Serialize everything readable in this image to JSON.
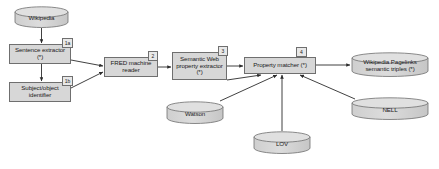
{
  "diagram": {
    "background": "#ffffff",
    "node_fill": "#d7d7d7",
    "node_stroke": "#6f6f6f",
    "badge_fill": "#e8e8e8",
    "nodes": [
      {
        "id": "wikipedia",
        "type": "cylinder",
        "label": "Wikipedia",
        "x": 14,
        "y": 6,
        "w": 55,
        "h": 22
      },
      {
        "id": "sentence",
        "type": "process",
        "label": "Sentence extractor (*)",
        "x": 9,
        "y": 44,
        "w": 62,
        "h": 20,
        "badge": "1a"
      },
      {
        "id": "subjobj",
        "type": "process",
        "label": "Subject/object identifier",
        "x": 9,
        "y": 82,
        "w": 62,
        "h": 20,
        "badge": "1b"
      },
      {
        "id": "fred",
        "type": "process",
        "label": "FRED machine reader",
        "x": 104,
        "y": 57,
        "w": 54,
        "h": 20,
        "badge": "2"
      },
      {
        "id": "swpe",
        "type": "process",
        "label": "Semantic Web property extractor (*)",
        "x": 172,
        "y": 52,
        "w": 55,
        "h": 28,
        "badge": "3"
      },
      {
        "id": "matcher",
        "type": "process",
        "label": "Property matcher (*)",
        "x": 244,
        "y": 57,
        "w": 72,
        "h": 17,
        "badge": "4"
      },
      {
        "id": "pagelinks",
        "type": "cylinder",
        "label": "Wikipedia Pagelinks semantic triples (*)",
        "x": 351,
        "y": 52,
        "w": 78,
        "h": 25
      },
      {
        "id": "nell",
        "type": "cylinder",
        "label": "NELL",
        "x": 351,
        "y": 97,
        "w": 78,
        "h": 23
      },
      {
        "id": "watson",
        "type": "cylinder",
        "label": "Watson",
        "x": 166,
        "y": 101,
        "w": 58,
        "h": 23
      },
      {
        "id": "lov",
        "type": "cylinder",
        "label": "LOV",
        "x": 253,
        "y": 131,
        "w": 58,
        "h": 23
      }
    ],
    "edges": [
      {
        "from": "wikipedia",
        "to": "sentence",
        "label": ""
      },
      {
        "from": "sentence",
        "to": "subjobj",
        "label": ""
      },
      {
        "from": "sentence",
        "to": "fred",
        "label": ""
      },
      {
        "from": "subjobj",
        "to": "fred",
        "label": ""
      },
      {
        "from": "fred",
        "to": "swpe",
        "label": ""
      },
      {
        "from": "swpe",
        "to": "matcher",
        "label": ""
      },
      {
        "from": "matcher",
        "to": "pagelinks",
        "label": ""
      },
      {
        "from": "watson",
        "to": "matcher",
        "label": ""
      },
      {
        "from": "lov",
        "to": "matcher",
        "label": ""
      },
      {
        "from": "nell",
        "to": "matcher",
        "label": ""
      },
      {
        "from": "swpe_low",
        "to": "matcher",
        "label": ""
      }
    ]
  }
}
